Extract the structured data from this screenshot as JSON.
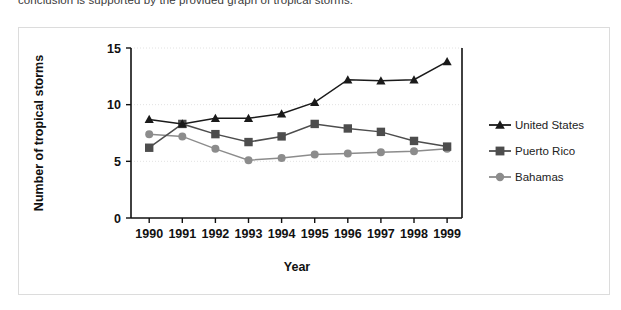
{
  "intro_text": "conclusion is supported by the provided graph of tropical storms.",
  "chart_data": {
    "type": "line",
    "title": "",
    "xlabel": "Year",
    "ylabel": "Number of tropical storms",
    "categories": [
      "1990",
      "1991",
      "1992",
      "1993",
      "1994",
      "1995",
      "1996",
      "1997",
      "1998",
      "1999"
    ],
    "x": [
      1990,
      1991,
      1992,
      1993,
      1994,
      1995,
      1996,
      1997,
      1998,
      1999
    ],
    "ylim": [
      0,
      15
    ],
    "yticks": [
      "0",
      "5",
      "10",
      "15"
    ],
    "ytick_values": [
      0,
      5,
      10,
      15
    ],
    "grid": true,
    "legend_position": "right",
    "series": [
      {
        "name": "United States",
        "marker": "triangle",
        "color": "#1a1a1a",
        "values": [
          8.7,
          8.3,
          8.8,
          8.8,
          9.2,
          10.2,
          12.2,
          12.1,
          12.2,
          13.8
        ]
      },
      {
        "name": "Puerto Rico",
        "marker": "square",
        "color": "#4d4d4d",
        "values": [
          6.2,
          8.3,
          7.4,
          6.7,
          7.2,
          8.3,
          7.9,
          7.6,
          6.8,
          6.3
        ]
      },
      {
        "name": "Bahamas",
        "marker": "circle",
        "color": "#8c8c8c",
        "values": [
          7.4,
          7.2,
          6.1,
          5.1,
          5.3,
          5.6,
          5.7,
          5.8,
          5.9,
          6.1
        ]
      }
    ]
  }
}
